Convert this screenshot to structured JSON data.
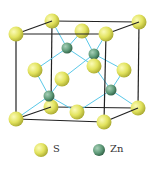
{
  "diagram": {
    "colors": {
      "S": "#e0e060",
      "Zn": "#5e9a78",
      "cell_edge": "#222222",
      "bond": "#5ac8e8"
    }
  },
  "legend": [
    {
      "symbol": "S",
      "label": "S",
      "color": "#e0e060"
    },
    {
      "symbol": "Zn",
      "label": "Zn",
      "color": "#5e9a78"
    }
  ]
}
